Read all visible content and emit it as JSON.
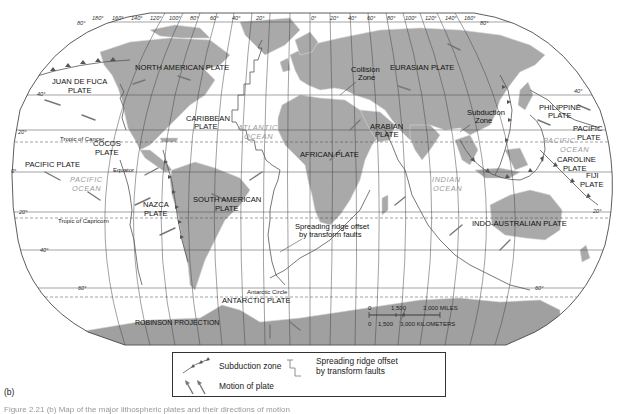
{
  "map": {
    "projection_label": "ROBINSON PROJECTION",
    "longitude_ticks_top": [
      "180°",
      "160°",
      "140°",
      "120°",
      "100°",
      "80°",
      "60°",
      "40°",
      "20°",
      "0°",
      "20°",
      "40°",
      "60°",
      "80°",
      "100°",
      "120°",
      "140°",
      "160°",
      "180°"
    ],
    "latitude_ticks": {
      "north_80": "80°",
      "north_40": "40°",
      "north_20": "20°",
      "equator": "0°",
      "south_20": "20°",
      "south_40": "40°",
      "south_60": "60°"
    },
    "reference_lines": {
      "tropic_cancer": "Tropic of Cancer",
      "equator": "Equator",
      "tropic_capricorn": "Tropic of Capricorn",
      "antarctic_circle": "Antarctic Circle"
    },
    "plates": {
      "north_american": "NORTH AMERICAN PLATE",
      "eurasian": "EURASIAN PLATE",
      "juan_de_fuca_1": "JUAN DE FUCA",
      "juan_de_fuca_2": "PLATE",
      "caribbean_1": "CARIBBEAN",
      "caribbean_2": "PLATE",
      "cocos_1": "COCOS",
      "cocos_2": "PLATE",
      "pacific_west": "PACIFIC PLATE",
      "nazca_1": "NAZCA",
      "nazca_2": "PLATE",
      "south_american_1": "SOUTH AMERICAN",
      "south_american_2": "PLATE",
      "african": "AFRICAN PLATE",
      "arabian_1": "ARABIAN",
      "arabian_2": "PLATE",
      "philippine_1": "PHILIPPINE",
      "philippine_2": "PLATE",
      "pacific_east_1": "PACIFIC",
      "pacific_east_2": "PLATE",
      "caroline_1": "CAROLINE",
      "caroline_2": "PLATE",
      "fiji_1": "FIJI",
      "fiji_2": "PLATE",
      "indo_australian": "INDO-AUSTRALIAN PLATE",
      "antarctic": "ANTARCTIC PLATE"
    },
    "oceans": {
      "atlantic_1": "ATLANTIC",
      "atlantic_2": "OCEAN",
      "pacific_w_1": "PACIFIC",
      "pacific_w_2": "OCEAN",
      "pacific_e_1": "PACIFIC",
      "pacific_e_2": "OCEAN",
      "indian_1": "INDIAN",
      "indian_2": "OCEAN"
    },
    "annotations": {
      "collision_1": "Collision",
      "collision_2": "Zone",
      "subduction_1": "Subduction",
      "subduction_2": "Zone",
      "ridge_1": "Spreading ridge offset",
      "ridge_2": "by transform faults"
    },
    "scale": {
      "miles_ticks": [
        "0",
        "1,500",
        "3,000 MILES"
      ],
      "km_ticks": [
        "0",
        "1,500",
        "3,000 KILOMETERS"
      ]
    },
    "colors": {
      "land": "#a9a9a9",
      "land_border": "#d6d6d6",
      "grid": "#444444",
      "ocean": "#ffffff",
      "ocean_label": "#9a9a9a",
      "antarctica": "#a0a0a0"
    }
  },
  "legend": {
    "subduction": "Subduction zone",
    "motion": "Motion of plate",
    "ridge_1": "Spreading ridge offset",
    "ridge_2": "by transform faults"
  },
  "panel_label": "(b)",
  "caption": "Figure 2.21 (b) Map of the major lithospheric plates and their directions of motion"
}
